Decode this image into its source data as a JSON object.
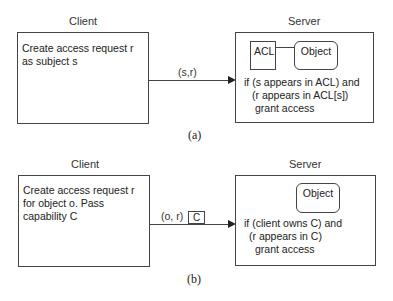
{
  "panel_a": {
    "client_label": "Client",
    "server_label": "Server",
    "client_text": [
      "Create access request r",
      "as subject s"
    ],
    "message_label": "(s,r)",
    "acl_label": "ACL",
    "object_label": "Object",
    "server_text": [
      "if (s appears in ACL) and",
      "(r appears in ACL[s])",
      "grant access"
    ],
    "caption": "(a)"
  },
  "panel_b": {
    "client_label": "Client",
    "server_label": "Server",
    "client_text": [
      "Create access request r",
      "for object o. Pass",
      "capability C"
    ],
    "message_label": "(o, r)",
    "capability_label": "C",
    "object_label": "Object",
    "server_text": [
      "if (client owns C) and",
      "(r appears in C)",
      "grant access"
    ],
    "caption": "(b)"
  }
}
